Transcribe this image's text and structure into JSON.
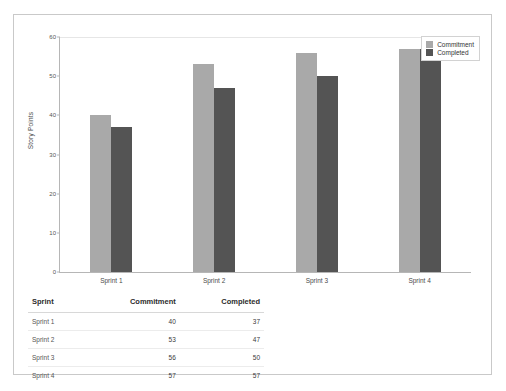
{
  "chart_data": {
    "type": "bar",
    "title": "",
    "xlabel": "",
    "ylabel": "Story Points",
    "ylim": [
      0,
      60
    ],
    "yticks": [
      0,
      10,
      20,
      30,
      40,
      50,
      60
    ],
    "grid": false,
    "legend_position": "top-right",
    "categories": [
      "Sprint 1",
      "Sprint 2",
      "Sprint 3",
      "Sprint 4"
    ],
    "series": [
      {
        "name": "Commitment",
        "color": "#a9a9a9",
        "values": [
          40,
          53,
          56,
          57
        ]
      },
      {
        "name": "Completed",
        "color": "#545454",
        "values": [
          37,
          47,
          50,
          57
        ]
      }
    ]
  },
  "legend": {
    "items": [
      {
        "label": "Commitment",
        "color": "#a9a9a9"
      },
      {
        "label": "Completed",
        "color": "#545454"
      }
    ]
  },
  "axis": {
    "y_title": "Story Points",
    "y_ticks": [
      "0",
      "10",
      "20",
      "30",
      "40",
      "50",
      "60"
    ],
    "x_ticks": [
      "Sprint 1",
      "Sprint 2",
      "Sprint 3",
      "Sprint 4"
    ]
  },
  "table": {
    "columns": [
      "Sprint",
      "Commitment",
      "Completed"
    ],
    "rows": [
      {
        "sprint": "Sprint 1",
        "commitment": "40",
        "completed": "37"
      },
      {
        "sprint": "Sprint 2",
        "commitment": "53",
        "completed": "47"
      },
      {
        "sprint": "Sprint 3",
        "commitment": "56",
        "completed": "50"
      },
      {
        "sprint": "Sprint 4",
        "commitment": "57",
        "completed": "57"
      }
    ]
  }
}
